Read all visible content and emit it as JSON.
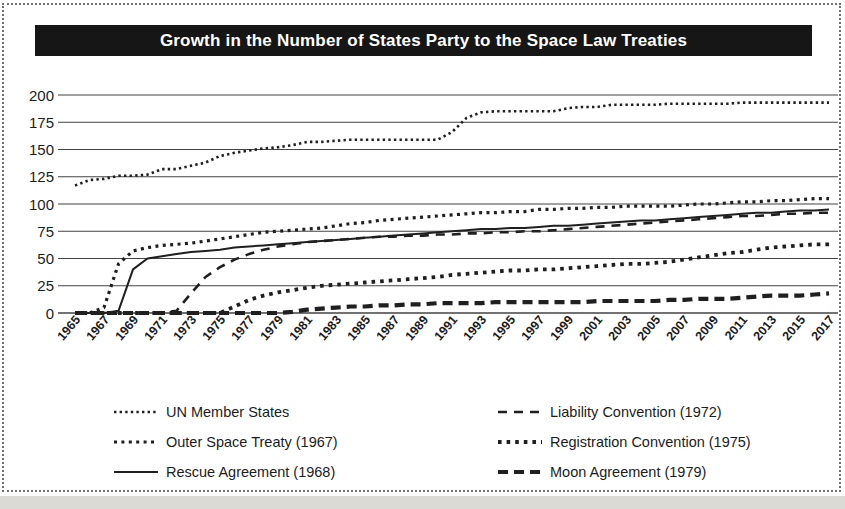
{
  "figure": {
    "title": "Growth in the Number of States Party to the Space Law Treaties"
  },
  "chart_data": {
    "type": "line",
    "title": "Growth in the Number of States Party to the Space Law Treaties",
    "xlabel": "",
    "ylabel": "",
    "ylim": [
      0,
      200
    ],
    "ytick_step": 25,
    "ytick_labels": [
      "0",
      "25",
      "50",
      "75",
      "100",
      "125",
      "150",
      "175",
      "200"
    ],
    "grid": "horizontal",
    "legend_position": "bottom",
    "x": [
      1965,
      1966,
      1967,
      1968,
      1969,
      1970,
      1971,
      1972,
      1973,
      1974,
      1975,
      1976,
      1977,
      1978,
      1979,
      1980,
      1981,
      1982,
      1983,
      1984,
      1985,
      1986,
      1987,
      1988,
      1989,
      1990,
      1991,
      1992,
      1993,
      1994,
      1995,
      1996,
      1997,
      1998,
      1999,
      2000,
      2001,
      2002,
      2003,
      2004,
      2005,
      2006,
      2007,
      2008,
      2009,
      2010,
      2011,
      2012,
      2013,
      2014,
      2015,
      2016,
      2017
    ],
    "x_tick_labels": [
      "1965",
      "1967",
      "1969",
      "1971",
      "1973",
      "1975",
      "1977",
      "1979",
      "1981",
      "1983",
      "1985",
      "1987",
      "1989",
      "1991",
      "1993",
      "1995",
      "1997",
      "1999",
      "2001",
      "2003",
      "2005",
      "2007",
      "2009",
      "2011",
      "2013",
      "2015",
      "2017"
    ],
    "series": [
      {
        "name": "UN Member States",
        "line_style": "fine-dotted",
        "stroke_width": 2.6,
        "dash": "2.4 3.2",
        "values": [
          117,
          122,
          123,
          126,
          126,
          127,
          132,
          132,
          135,
          138,
          144,
          147,
          149,
          151,
          152,
          154,
          157,
          157,
          158,
          159,
          159,
          159,
          159,
          159,
          159,
          159,
          166,
          179,
          184,
          185,
          185,
          185,
          185,
          185,
          188,
          189,
          189,
          191,
          191,
          191,
          191,
          192,
          192,
          192,
          192,
          192,
          193,
          193,
          193,
          193,
          193,
          193,
          193
        ]
      },
      {
        "name": "Outer Space Treaty (1967)",
        "line_style": "dotted",
        "stroke_width": 3.2,
        "dash": "3 4.4",
        "values": [
          0,
          0,
          5,
          45,
          57,
          60,
          62,
          63,
          64,
          66,
          68,
          70,
          72,
          74,
          75,
          76,
          77,
          78,
          80,
          82,
          83,
          85,
          86,
          87,
          88,
          89,
          90,
          91,
          92,
          92,
          93,
          93,
          95,
          95,
          96,
          96,
          97,
          97,
          98,
          98,
          98,
          98,
          99,
          100,
          100,
          101,
          102,
          102,
          103,
          103,
          104,
          105,
          105
        ]
      },
      {
        "name": "Rescue Agreement (1968)",
        "line_style": "solid",
        "stroke_width": 2,
        "dash": "",
        "values": [
          0,
          0,
          0,
          2,
          40,
          50,
          52,
          54,
          56,
          57,
          58,
          60,
          61,
          62,
          63,
          64,
          65,
          66,
          67,
          68,
          69,
          70,
          71,
          72,
          73,
          74,
          75,
          76,
          77,
          77,
          78,
          78,
          79,
          80,
          80,
          81,
          82,
          83,
          84,
          85,
          85,
          86,
          87,
          88,
          89,
          90,
          91,
          92,
          92,
          93,
          94,
          94,
          95
        ]
      },
      {
        "name": "Liability Convention (1972)",
        "line_style": "dashed",
        "stroke_width": 2.6,
        "dash": "9 7",
        "values": [
          0,
          0,
          0,
          0,
          0,
          0,
          0,
          2,
          18,
          33,
          42,
          49,
          54,
          58,
          61,
          63,
          65,
          66,
          67,
          68,
          69,
          70,
          70,
          71,
          71,
          72,
          72,
          73,
          73,
          74,
          74,
          75,
          75,
          76,
          77,
          78,
          79,
          80,
          81,
          82,
          83,
          84,
          85,
          86,
          87,
          88,
          89,
          89,
          90,
          91,
          91,
          92,
          92
        ]
      },
      {
        "name": "Registration Convention (1975)",
        "line_style": "bold-dotted",
        "stroke_width": 3.8,
        "dash": "3.6 5",
        "values": [
          0,
          0,
          0,
          0,
          0,
          0,
          0,
          0,
          0,
          0,
          0,
          6,
          12,
          16,
          19,
          21,
          23,
          25,
          26,
          27,
          28,
          29,
          30,
          31,
          32,
          33,
          35,
          36,
          37,
          38,
          39,
          39,
          40,
          40,
          41,
          42,
          43,
          44,
          45,
          45,
          46,
          47,
          49,
          51,
          53,
          55,
          56,
          58,
          60,
          61,
          62,
          63,
          63
        ]
      },
      {
        "name": "Moon Agreement (1979)",
        "line_style": "bold-dashed",
        "stroke_width": 4.2,
        "dash": "10 6",
        "values": [
          0,
          0,
          0,
          0,
          0,
          0,
          0,
          0,
          0,
          0,
          0,
          0,
          0,
          0,
          0,
          1,
          3,
          4,
          5,
          6,
          6,
          7,
          7,
          8,
          8,
          9,
          9,
          9,
          9,
          10,
          10,
          10,
          10,
          10,
          10,
          10,
          11,
          11,
          11,
          11,
          11,
          12,
          12,
          13,
          13,
          13,
          14,
          15,
          16,
          16,
          16,
          17,
          18
        ]
      }
    ],
    "line_color": "#1f1f1f",
    "gridline_color": "#434343",
    "legend_display_order": [
      0,
      3,
      1,
      4,
      2,
      5
    ]
  }
}
